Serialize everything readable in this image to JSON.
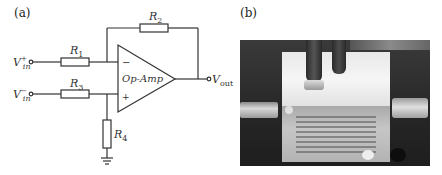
{
  "figure": {
    "panel_a": {
      "label": "(a)",
      "opamp_label": "Op-Amp",
      "inverting_sign": "−",
      "noninverting_sign": "+",
      "inputs": [
        {
          "name": "V",
          "sub": "in",
          "sup": "+"
        },
        {
          "name": "V",
          "sub": "in",
          "sup": "−"
        }
      ],
      "output": {
        "name": "V",
        "sub": "out"
      },
      "resistors": [
        {
          "name": "R",
          "sub": "1"
        },
        {
          "name": "R",
          "sub": "2"
        },
        {
          "name": "R",
          "sub": "3"
        },
        {
          "name": "R",
          "sub": "4"
        }
      ]
    },
    "panel_b": {
      "label": "(b)"
    }
  }
}
